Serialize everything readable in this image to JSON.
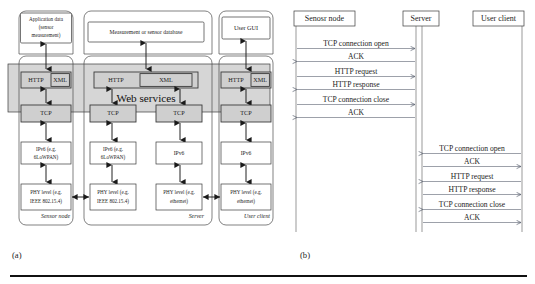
{
  "figure": {
    "captions": {
      "a": "(a)",
      "b": "(b)"
    }
  },
  "panel_a": {
    "web_services_band_label": "Web services",
    "columns": [
      {
        "id": "sensor-node",
        "footer_label": "Sensor node",
        "top_box": "Application data (sensor measurement)",
        "top_box_lines": [
          "Application data",
          "(sensor",
          "measurement)"
        ],
        "stacks": [
          {
            "layers": [
              {
                "name": "http-xml",
                "left": "HTTP",
                "right": "XML"
              },
              {
                "name": "tcp",
                "label": "TCP"
              },
              {
                "name": "ipv6",
                "lines": [
                  "IPv6 (e.g.",
                  "6LoWPAN)"
                ]
              },
              {
                "name": "phy",
                "lines": [
                  "PHY level (e.g.",
                  "IEEE 802.15.4)"
                ]
              }
            ]
          }
        ]
      },
      {
        "id": "server",
        "footer_label": "Server",
        "top_box": "Measurement or sensor database",
        "top_box_lines": [
          "Measurement or sensor database"
        ],
        "stacks": [
          {
            "layers": [
              {
                "name": "http-xml",
                "left": "HTTP",
                "right": "XML"
              },
              {
                "name": "tcp",
                "label": "TCP"
              },
              {
                "name": "ipv6",
                "lines": [
                  "IPv6 (e.g.",
                  "6LoWPAN)"
                ]
              },
              {
                "name": "phy",
                "lines": [
                  "PHY level (e.g.",
                  "IEEE 802.15.4)"
                ]
              }
            ]
          },
          {
            "layers": [
              {
                "name": "tcp",
                "label": "TCP"
              },
              {
                "name": "ipv6",
                "lines": [
                  "IPv6"
                ]
              },
              {
                "name": "phy",
                "lines": [
                  "PHY level (e.g.",
                  "ethernet)"
                ]
              }
            ]
          }
        ]
      },
      {
        "id": "user-client",
        "footer_label": "User client",
        "top_box": "User GUI",
        "top_box_lines": [
          "User GUI"
        ],
        "stacks": [
          {
            "layers": [
              {
                "name": "http-xml",
                "left": "HTTP",
                "right": "XML"
              },
              {
                "name": "tcp",
                "label": "TCP"
              },
              {
                "name": "ipv6",
                "lines": [
                  "IPv6"
                ]
              },
              {
                "name": "phy",
                "lines": [
                  "PHY level (e.g.",
                  "ethernet)"
                ]
              }
            ]
          }
        ]
      }
    ]
  },
  "panel_b": {
    "lifelines": [
      {
        "id": "sensor-node",
        "label": "Senosr node"
      },
      {
        "id": "server",
        "label": "Server"
      },
      {
        "id": "user-client",
        "label": "User client"
      }
    ],
    "exchanges": [
      {
        "id": "sensor-to-server",
        "from": "sensor-node",
        "to": "server",
        "messages": [
          {
            "label": "TCP connection open",
            "direction": "right"
          },
          {
            "label": "ACK",
            "direction": "left"
          },
          {
            "label": "HTTP request",
            "direction": "right"
          },
          {
            "label": "HTTP response",
            "direction": "left"
          },
          {
            "label": "TCP connection close",
            "direction": "right"
          },
          {
            "label": "ACK",
            "direction": "left"
          }
        ]
      },
      {
        "id": "client-to-server",
        "from": "user-client",
        "to": "server",
        "messages": [
          {
            "label": "TCP connection open",
            "direction": "left"
          },
          {
            "label": "ACK",
            "direction": "right"
          },
          {
            "label": "HTTP request",
            "direction": "left"
          },
          {
            "label": "HTTP response",
            "direction": "right"
          },
          {
            "label": "TCP connection close",
            "direction": "left"
          },
          {
            "label": "ACK",
            "direction": "right"
          }
        ]
      }
    ]
  }
}
